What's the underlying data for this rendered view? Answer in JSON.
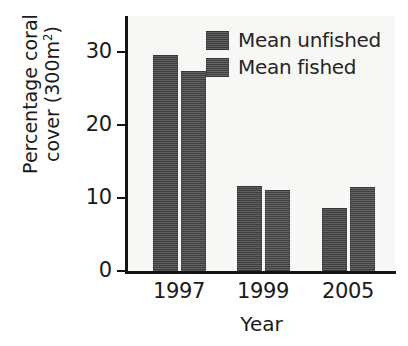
{
  "chart_data": {
    "type": "bar",
    "title": "",
    "xlabel": "Year",
    "ylabel_line1": "Percentage coral",
    "ylabel_line2_prefix": "cover (300m",
    "ylabel_line2_sup": "2",
    "ylabel_line2_suffix": ")",
    "categories": [
      "1997",
      "1999",
      "2005"
    ],
    "series": [
      {
        "name": "Mean unfished",
        "values": [
          29.6,
          11.7,
          8.6
        ]
      },
      {
        "name": "Mean fished",
        "values": [
          27.5,
          11.1,
          11.5
        ]
      }
    ],
    "ylim": [
      0,
      35
    ],
    "yticks": [
      0,
      10,
      20,
      30
    ],
    "ytick_labels": [
      "0",
      "10",
      "20",
      "30"
    ],
    "grid": false,
    "legend_position": "top-right",
    "colors": {
      "bar_unfished": "#4d4d4d",
      "bar_fished": "#515151",
      "axis": "#131313",
      "plot_background": "#f7f7f5",
      "figure_background": "#ffffff",
      "text": "#1a1a1a"
    }
  },
  "legend": {
    "items": [
      {
        "label": "Mean unfished"
      },
      {
        "label": "Mean fished"
      }
    ]
  }
}
